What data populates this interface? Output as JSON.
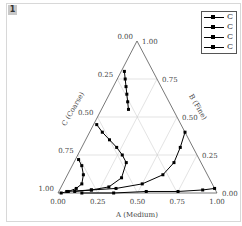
{
  "figure": {
    "badge": "1"
  },
  "legend": {
    "items": [
      {
        "label": "C"
      },
      {
        "label": "C"
      },
      {
        "label": "C"
      },
      {
        "label": "C"
      }
    ]
  },
  "axes": {
    "a_label": "A (Medium)",
    "b_label": "B (Fine)",
    "c_label": "C (Coarse)",
    "a_ticks": [
      "0.00",
      "0.25",
      "0.50",
      "0.75",
      "1.00"
    ],
    "b_ticks": [
      "0.00",
      "0.25",
      "0.50",
      "0.75",
      "1.00"
    ],
    "c_ticks": [
      "0.00",
      "0.25",
      "0.50",
      "0.75",
      "1.00"
    ]
  },
  "chart_data": {
    "type": "scatter",
    "subtype": "ternary",
    "title": "",
    "axes": {
      "A": "A (Medium)",
      "B": "B (Fine)",
      "C": "C (Coarse)"
    },
    "range": [
      0,
      1
    ],
    "grid": true,
    "legend_position": "top-right",
    "series": [
      {
        "name": "C",
        "points_ABC": [
          [
            0.02,
            0.8,
            0.18
          ],
          [
            0.05,
            0.75,
            0.2
          ],
          [
            0.08,
            0.7,
            0.22
          ],
          [
            0.11,
            0.65,
            0.24
          ],
          [
            0.14,
            0.6,
            0.26
          ],
          [
            0.17,
            0.55,
            0.28
          ]
        ]
      },
      {
        "name": "C",
        "points_ABC": [
          [
            0.02,
            0.45,
            0.53
          ],
          [
            0.08,
            0.4,
            0.52
          ],
          [
            0.15,
            0.35,
            0.5
          ],
          [
            0.22,
            0.3,
            0.48
          ],
          [
            0.28,
            0.25,
            0.47
          ],
          [
            0.33,
            0.2,
            0.47
          ],
          [
            0.35,
            0.1,
            0.55
          ],
          [
            0.3,
            0.04,
            0.66
          ],
          [
            0.2,
            0.02,
            0.78
          ],
          [
            0.1,
            0.01,
            0.89
          ]
        ]
      },
      {
        "name": "C",
        "points_ABC": [
          [
            0.02,
            0.22,
            0.76
          ],
          [
            0.06,
            0.18,
            0.76
          ],
          [
            0.1,
            0.12,
            0.78
          ],
          [
            0.12,
            0.06,
            0.82
          ],
          [
            0.1,
            0.03,
            0.87
          ],
          [
            0.06,
            0.01,
            0.93
          ],
          [
            0.02,
            0.0,
            0.98
          ]
        ]
      },
      {
        "name": "C",
        "points_ABC": [
          [
            0.6,
            0.4,
            0.0
          ],
          [
            0.62,
            0.3,
            0.08
          ],
          [
            0.63,
            0.2,
            0.17
          ],
          [
            0.6,
            0.12,
            0.28
          ],
          [
            0.5,
            0.06,
            0.44
          ],
          [
            0.35,
            0.03,
            0.62
          ],
          [
            0.2,
            0.02,
            0.78
          ],
          [
            0.05,
            0.01,
            0.94
          ]
        ]
      },
      {
        "name": "C",
        "points_ABC": [
          [
            0.97,
            0.03,
            0.0
          ],
          [
            0.9,
            0.02,
            0.08
          ],
          [
            0.75,
            0.01,
            0.24
          ],
          [
            0.55,
            0.01,
            0.44
          ],
          [
            0.35,
            0.0,
            0.65
          ],
          [
            0.15,
            0.0,
            0.85
          ]
        ]
      }
    ]
  }
}
